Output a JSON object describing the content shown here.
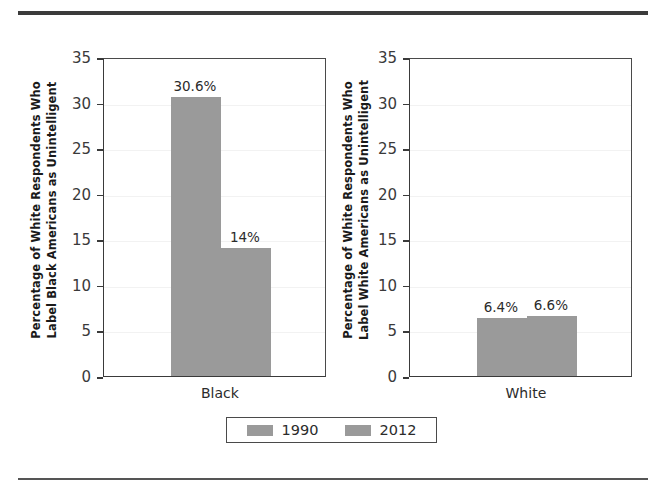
{
  "figure": {
    "top_rule": "horizontal-rule",
    "bottom_rule": "horizontal-rule"
  },
  "legend": {
    "entries": [
      {
        "label": "1990",
        "color": "#9a9a9a"
      },
      {
        "label": "2012",
        "color": "#9a9a9a"
      }
    ]
  },
  "axis": {
    "ticks": [
      "35",
      "30",
      "25",
      "20",
      "15",
      "10",
      "5",
      "0"
    ]
  },
  "panels": [
    {
      "id": "black",
      "ylabel_line1": "Percentage of White Respondents Who",
      "ylabel_line2": "Label Black Americans as Unintelligent",
      "category": "Black",
      "bars": [
        {
          "series": "1990",
          "value": 30.6,
          "label": "30.6%"
        },
        {
          "series": "2012",
          "value": 14.0,
          "label": "14%"
        }
      ]
    },
    {
      "id": "white",
      "ylabel_line1": "Percentage of White Respondents Who",
      "ylabel_line2": "Label White Americans as Unintelligent",
      "category": "White",
      "bars": [
        {
          "series": "1990",
          "value": 6.4,
          "label": "6.4%"
        },
        {
          "series": "2012",
          "value": 6.6,
          "label": "6.6%"
        }
      ]
    }
  ],
  "chart_data": {
    "type": "bar",
    "title": "",
    "subtitle": "",
    "xlabel": "",
    "ylabel": "Percentage of White Respondents Who Label Americans as Unintelligent",
    "ylim": [
      0,
      35
    ],
    "yticks": [
      0,
      5,
      10,
      15,
      20,
      25,
      30,
      35
    ],
    "grid": true,
    "legend_position": "bottom",
    "legend_entries": [
      "1990",
      "2012"
    ],
    "panels": [
      {
        "name": "Black",
        "ylabel": "Percentage of White Respondents Who Label Black Americans as Unintelligent",
        "categories": [
          "Black"
        ],
        "series": [
          {
            "name": "1990",
            "values": [
              30.6
            ],
            "labels": [
              "30.6%"
            ]
          },
          {
            "name": "2012",
            "values": [
              14.0
            ],
            "labels": [
              "14%"
            ]
          }
        ]
      },
      {
        "name": "White",
        "ylabel": "Percentage of White Respondents Who Label White Americans as Unintelligent",
        "categories": [
          "White"
        ],
        "series": [
          {
            "name": "1990",
            "values": [
              6.4
            ],
            "labels": [
              "6.4%"
            ]
          },
          {
            "name": "2012",
            "values": [
              6.6
            ],
            "labels": [
              "6.6%"
            ]
          }
        ]
      }
    ],
    "colors": {
      "bar": "#9a9a9a",
      "axis": "#3a3a3a",
      "grid": "#f2f2f2"
    }
  }
}
